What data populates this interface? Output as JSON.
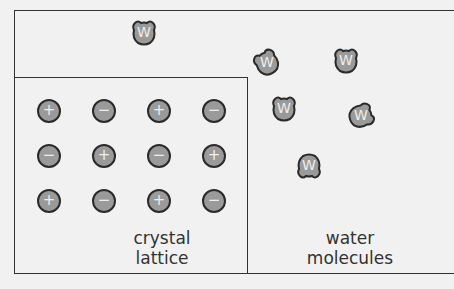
{
  "diagram": {
    "lattice_label": [
      "crystal",
      "lattice"
    ],
    "water_label": [
      "water",
      "molecules"
    ],
    "ions": [
      {
        "row": 0,
        "col": 0,
        "sign": "+"
      },
      {
        "row": 0,
        "col": 1,
        "sign": "−"
      },
      {
        "row": 0,
        "col": 2,
        "sign": "+"
      },
      {
        "row": 0,
        "col": 3,
        "sign": "−"
      },
      {
        "row": 1,
        "col": 0,
        "sign": "−"
      },
      {
        "row": 1,
        "col": 1,
        "sign": "+"
      },
      {
        "row": 1,
        "col": 2,
        "sign": "−"
      },
      {
        "row": 1,
        "col": 3,
        "sign": "+"
      },
      {
        "row": 2,
        "col": 0,
        "sign": "+"
      },
      {
        "row": 2,
        "col": 1,
        "sign": "−"
      },
      {
        "row": 2,
        "col": 2,
        "sign": "+"
      },
      {
        "row": 2,
        "col": 3,
        "sign": "−"
      }
    ],
    "water_molecules": [
      {
        "label": "W",
        "x": 144,
        "y": 33,
        "rot": 0
      },
      {
        "label": "W",
        "x": 267,
        "y": 63,
        "rot": -30
      },
      {
        "label": "W",
        "x": 346,
        "y": 61,
        "rot": 0
      },
      {
        "label": "W",
        "x": 284,
        "y": 109,
        "rot": 0
      },
      {
        "label": "W",
        "x": 361,
        "y": 116,
        "rot": 70
      },
      {
        "label": "W",
        "x": 309,
        "y": 166,
        "rot": 180
      }
    ],
    "colors": {
      "molecule_fill": "#9a9a9a",
      "outline": "#2a2a2a",
      "background": "#f1f1f1"
    }
  }
}
